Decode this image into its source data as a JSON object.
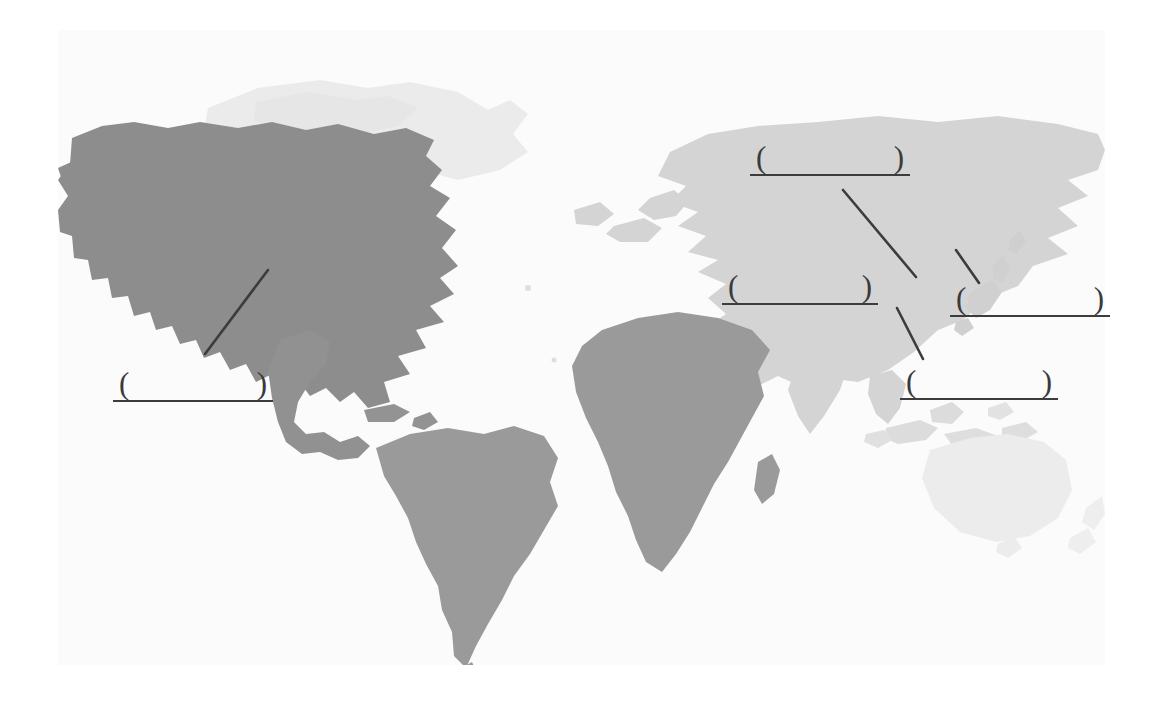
{
  "worksheet": {
    "type": "world-map-fill-in-the-blank",
    "instruction_text": "",
    "blank_count": 5,
    "blank_marker_open": "(",
    "blank_marker_close": ")"
  },
  "colors": {
    "page_background": "#ffffff",
    "map_background": "#fbfbfb",
    "land_highlight_dark": "#8e8e8e",
    "land_mid": "#9a9a9a",
    "land_light": "#d2d2d2",
    "land_faint": "#eaeaea",
    "ink": "#3c3c3c",
    "paren_ink": "#3a3a3a"
  },
  "map": {
    "name": "world-map",
    "projection_note": "equirectangular world silhouette",
    "regions": [
      {
        "id": "north-america",
        "label": "North America",
        "shade": "#8e8e8e"
      },
      {
        "id": "south-america",
        "label": "South America",
        "shade": "#9a9a9a"
      },
      {
        "id": "africa",
        "label": "Africa",
        "shade": "#9a9a9a"
      },
      {
        "id": "eurasia",
        "label": "Eurasia",
        "shade": "#d2d2d2"
      },
      {
        "id": "greenland",
        "label": "Greenland",
        "shade": "#eaeaea"
      },
      {
        "id": "australia",
        "label": "Australia",
        "shade": "#eaeaea"
      },
      {
        "id": "japan",
        "label": "Japan",
        "shade": "#d2d2d2"
      },
      {
        "id": "southeast-asia",
        "label": "Southeast Asia",
        "shade": "#d8d8d8"
      }
    ]
  },
  "blanks": [
    {
      "id": "blank-1",
      "target_region": "north-america",
      "answer": "",
      "open": "(",
      "close": ")",
      "x": 113,
      "y": 368,
      "w": 160,
      "leader": {
        "x1": 268,
        "y1": 270,
        "x2": 205,
        "y2": 354
      }
    },
    {
      "id": "blank-2",
      "target_region": "east-asia-coast",
      "answer": "",
      "open": "(",
      "close": ")",
      "x": 750,
      "y": 142,
      "w": 160,
      "leader": {
        "x1": 843,
        "y1": 190,
        "x2": 916,
        "y2": 277
      }
    },
    {
      "id": "blank-3",
      "target_region": "china",
      "answer": "",
      "open": "(",
      "close": ")",
      "x": 722,
      "y": 271,
      "w": 156,
      "leader": null
    },
    {
      "id": "blank-4",
      "target_region": "japan",
      "answer": "",
      "open": "(",
      "close": ")",
      "x": 950,
      "y": 283,
      "w": 160,
      "leader": {
        "x1": 956,
        "y1": 250,
        "x2": 979,
        "y2": 283
      }
    },
    {
      "id": "blank-5",
      "target_region": "southeast-asia",
      "answer": "",
      "open": "(",
      "close": ")",
      "x": 900,
      "y": 366,
      "w": 158,
      "leader": {
        "x1": 897,
        "y1": 308,
        "x2": 923,
        "y2": 359
      }
    }
  ]
}
